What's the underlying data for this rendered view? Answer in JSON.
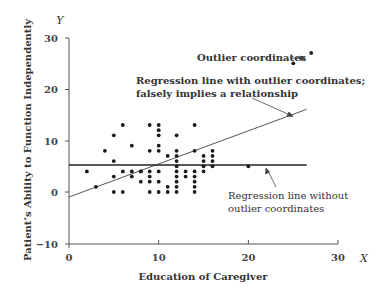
{
  "chart_data": {
    "type": "scatter",
    "title": "",
    "xlabel": "Education of Caregiver",
    "ylabel": "Patient's Ability to Function Independently",
    "x_var": "X",
    "y_var": "Y",
    "xlim": [
      0,
      30
    ],
    "ylim": [
      -10,
      30
    ],
    "x_ticks": [
      "0",
      "10",
      "20",
      "30"
    ],
    "y_ticks": [
      "30",
      "20",
      "10",
      "0",
      "-10"
    ],
    "grid": false,
    "legend": "none",
    "series": [
      {
        "name": "Coordinates",
        "points": [
          [
            2,
            4
          ],
          [
            3,
            1
          ],
          [
            4,
            8
          ],
          [
            5,
            6
          ],
          [
            5,
            3
          ],
          [
            5,
            0
          ],
          [
            5,
            11
          ],
          [
            6,
            4
          ],
          [
            6,
            0
          ],
          [
            6,
            13
          ],
          [
            7,
            4
          ],
          [
            7,
            3
          ],
          [
            7,
            9
          ],
          [
            8,
            4
          ],
          [
            8,
            2
          ],
          [
            8,
            4
          ],
          [
            9,
            0
          ],
          [
            9,
            2
          ],
          [
            9,
            3
          ],
          [
            9,
            4
          ],
          [
            9,
            8
          ],
          [
            9,
            13
          ],
          [
            10,
            0
          ],
          [
            10,
            8
          ],
          [
            10,
            9
          ],
          [
            10,
            11
          ],
          [
            10,
            12
          ],
          [
            10,
            13
          ],
          [
            10,
            2
          ],
          [
            10,
            4
          ],
          [
            11,
            7
          ],
          [
            11,
            1
          ],
          [
            11,
            0
          ],
          [
            12,
            0
          ],
          [
            12,
            1
          ],
          [
            12,
            2
          ],
          [
            12,
            3
          ],
          [
            12,
            4
          ],
          [
            12,
            5
          ],
          [
            12,
            6
          ],
          [
            12,
            7
          ],
          [
            12,
            8
          ],
          [
            12,
            11
          ],
          [
            13,
            4
          ],
          [
            13,
            3
          ],
          [
            14,
            0
          ],
          [
            14,
            1
          ],
          [
            14,
            2
          ],
          [
            14,
            3
          ],
          [
            14,
            4
          ],
          [
            14,
            8
          ],
          [
            14,
            13
          ],
          [
            15,
            4
          ],
          [
            15,
            5
          ],
          [
            15,
            6
          ],
          [
            15,
            7
          ],
          [
            16,
            5
          ],
          [
            16,
            6
          ],
          [
            16,
            7
          ],
          [
            16,
            8
          ],
          [
            20,
            5
          ]
        ]
      },
      {
        "name": "Outlier coordinates",
        "points": [
          [
            25,
            25
          ],
          [
            26,
            26
          ],
          [
            27,
            27
          ]
        ]
      }
    ],
    "lines": [
      {
        "name": "Regression line with outlier coordinates",
        "from": [
          0,
          -1
        ],
        "to": [
          26.5,
          16
        ]
      },
      {
        "name": "Regression line without outlier coordinates",
        "from": [
          0,
          5.2
        ],
        "to": [
          26.5,
          5.2
        ]
      }
    ],
    "annotations": [
      {
        "text": "Outlier coordinates",
        "target": [
          25,
          25
        ]
      },
      {
        "text_lines": [
          "Regression line with outlier coordinates;",
          "falsely implies a relationship"
        ],
        "target": [
          24.5,
          14.6
        ]
      },
      {
        "text_lines": [
          "Regression line without",
          "outlier coordinates"
        ],
        "target": [
          21,
          5.2
        ]
      }
    ]
  },
  "labels": {
    "xlabel": "Education of Caregiver",
    "ylabel": "Patient’s Ability to Function Independently",
    "x_var": "X",
    "y_var": "Y",
    "x_ticks": [
      "0",
      "10",
      "20",
      "30"
    ],
    "y_ticks": [
      "30",
      "20",
      "10",
      "0",
      "−10"
    ],
    "outlier_label": "Outlier coordinates",
    "reg_with_line1": "Regression line with outlier coordinates;",
    "reg_with_line2": "falsely implies a relationship",
    "reg_without_line1": "Regression line without",
    "reg_without_line2": "outlier coordinates"
  }
}
